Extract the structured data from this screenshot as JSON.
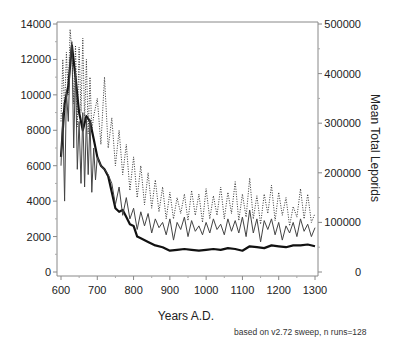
{
  "chart_data": {
    "type": "line",
    "title": "",
    "xlabel": "Years A.D.",
    "ylabel": "",
    "ylabel_right": "Mean Total Leporids",
    "xlim": [
      600,
      1300
    ],
    "ylim": [
      0,
      14000
    ],
    "ylim_right": [
      0,
      500000
    ],
    "x_ticks": [
      600,
      700,
      800,
      900,
      1000,
      1100,
      1200,
      1300
    ],
    "y_ticks": [
      0,
      2000,
      4000,
      6000,
      8000,
      10000,
      12000,
      14000
    ],
    "y_ticks_right": [
      0,
      100000,
      200000,
      300000,
      400000,
      500000
    ],
    "grid": false,
    "legend": null,
    "annotation": "based on v2.72 sweep, n runs=128",
    "series": [
      {
        "name": "mean (thick solid)",
        "style": "thick-solid",
        "x": [
          600,
          610,
          620,
          630,
          640,
          650,
          660,
          670,
          680,
          690,
          700,
          710,
          720,
          730,
          740,
          750,
          760,
          770,
          780,
          790,
          800,
          810,
          820,
          840,
          860,
          880,
          900,
          920,
          940,
          960,
          980,
          1000,
          1020,
          1040,
          1060,
          1080,
          1100,
          1120,
          1140,
          1160,
          1180,
          1200,
          1220,
          1240,
          1260,
          1280,
          1300
        ],
        "values": [
          6500,
          9500,
          10500,
          12800,
          11000,
          9000,
          8000,
          8800,
          8500,
          7500,
          6500,
          6000,
          5800,
          5400,
          4500,
          3600,
          3400,
          3500,
          3100,
          2700,
          2600,
          2000,
          1900,
          1700,
          1500,
          1400,
          1200,
          1250,
          1300,
          1250,
          1200,
          1250,
          1300,
          1250,
          1350,
          1300,
          1200,
          1450,
          1400,
          1350,
          1500,
          1450,
          1400,
          1500,
          1500,
          1550,
          1450
        ]
      },
      {
        "name": "thin solid",
        "style": "thin-solid",
        "x": [
          600,
          605,
          610,
          615,
          620,
          625,
          630,
          635,
          640,
          645,
          650,
          655,
          660,
          665,
          670,
          675,
          680,
          685,
          690,
          695,
          700,
          710,
          720,
          730,
          740,
          750,
          760,
          770,
          780,
          790,
          800,
          810,
          820,
          830,
          840,
          850,
          860,
          870,
          880,
          890,
          900,
          910,
          920,
          930,
          940,
          950,
          960,
          970,
          980,
          990,
          1000,
          1010,
          1020,
          1030,
          1040,
          1050,
          1060,
          1070,
          1080,
          1090,
          1100,
          1110,
          1120,
          1130,
          1140,
          1150,
          1160,
          1170,
          1180,
          1190,
          1200,
          1210,
          1220,
          1230,
          1240,
          1250,
          1260,
          1270,
          1280,
          1290,
          1300
        ],
        "values": [
          6000,
          9000,
          4000,
          10200,
          8500,
          12000,
          13000,
          7000,
          11500,
          5800,
          8500,
          5000,
          9000,
          4800,
          8700,
          5500,
          8600,
          4500,
          7000,
          5200,
          6500,
          6000,
          5800,
          5500,
          5000,
          3800,
          4800,
          3200,
          4200,
          3000,
          3600,
          2400,
          3400,
          2600,
          3300,
          2200,
          3000,
          2500,
          2800,
          2100,
          3000,
          1800,
          2800,
          2400,
          3100,
          2000,
          2900,
          2300,
          2600,
          2100,
          2800,
          2200,
          3000,
          2400,
          2700,
          2100,
          3000,
          2300,
          2900,
          2200,
          3100,
          2000,
          3500,
          2200,
          3000,
          1700,
          2900,
          2400,
          3000,
          2100,
          2800,
          1800,
          2600,
          2200,
          2800,
          2000,
          3000,
          2300,
          2700,
          2000,
          2500
        ]
      },
      {
        "name": "dotted upper",
        "style": "dotted",
        "x": [
          600,
          605,
          610,
          615,
          620,
          625,
          630,
          635,
          640,
          645,
          650,
          655,
          660,
          665,
          670,
          675,
          680,
          685,
          690,
          700,
          710,
          720,
          730,
          740,
          750,
          760,
          770,
          780,
          790,
          800,
          810,
          820,
          830,
          840,
          850,
          860,
          870,
          880,
          890,
          900,
          910,
          920,
          930,
          940,
          950,
          960,
          970,
          980,
          990,
          1000,
          1010,
          1020,
          1030,
          1040,
          1050,
          1060,
          1070,
          1080,
          1090,
          1100,
          1110,
          1120,
          1130,
          1140,
          1150,
          1160,
          1170,
          1180,
          1190,
          1200,
          1210,
          1220,
          1230,
          1240,
          1250,
          1260,
          1270,
          1280,
          1290,
          1300
        ],
        "values": [
          8500,
          12000,
          9000,
          12400,
          10000,
          13700,
          12500,
          9500,
          12800,
          8200,
          12700,
          9000,
          13200,
          8500,
          12000,
          7800,
          11000,
          8000,
          8800,
          9800,
          7200,
          11000,
          7000,
          8700,
          6000,
          8000,
          5500,
          7200,
          4600,
          6500,
          4200,
          6000,
          3800,
          5600,
          3600,
          5200,
          3400,
          4800,
          3000,
          4500,
          3000,
          4200,
          3300,
          4400,
          2900,
          4600,
          3200,
          4400,
          2800,
          4700,
          3000,
          4300,
          3200,
          4800,
          3000,
          4500,
          3300,
          5100,
          2900,
          4400,
          3100,
          5300,
          3000,
          4300,
          2700,
          4400,
          3300,
          4900,
          2900,
          4500,
          3200,
          4200,
          2600,
          3700,
          3100,
          4700,
          3000,
          4400,
          2800,
          3300
        ]
      }
    ]
  },
  "axes": {
    "x_title": "Years A.D.",
    "right_title": "Mean Total Leporids",
    "footnote": "based on v2.72 sweep, n runs=128"
  }
}
